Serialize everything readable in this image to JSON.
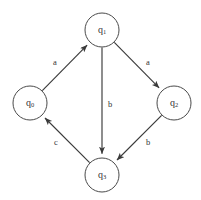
{
  "diagram": {
    "type": "state-transition-diagram",
    "title": "",
    "width": 201,
    "height": 200,
    "background_color": "#ffffff",
    "node_stroke_color": "#4a4a4a",
    "edge_color": "#3a3a3a",
    "text_color": "#333333",
    "nodes": [
      {
        "id": "q0",
        "base": "q",
        "sub": "0",
        "label": "q0",
        "cx": 30,
        "cy": 103,
        "r": 17
      },
      {
        "id": "q1",
        "base": "q",
        "sub": "1",
        "label": "q1",
        "cx": 102,
        "cy": 30,
        "r": 17
      },
      {
        "id": "q2",
        "base": "q",
        "sub": "2",
        "label": "q2",
        "cx": 174,
        "cy": 103,
        "r": 17
      },
      {
        "id": "q3",
        "base": "q",
        "sub": "3",
        "label": "q3",
        "cx": 102,
        "cy": 175,
        "r": 17
      }
    ],
    "edges": [
      {
        "id": "e0",
        "from": "q0",
        "to": "q1",
        "label": "a",
        "label_x": 55,
        "label_y": 63
      },
      {
        "id": "e1",
        "from": "q1",
        "to": "q2",
        "label": "a",
        "label_x": 148,
        "label_y": 63
      },
      {
        "id": "e2",
        "from": "q1",
        "to": "q3",
        "label": "b",
        "label_x": 110,
        "label_y": 105
      },
      {
        "id": "e3",
        "from": "q2",
        "to": "q3",
        "label": "b",
        "label_x": 148,
        "label_y": 143
      },
      {
        "id": "e4",
        "from": "q3",
        "to": "q0",
        "label": "c",
        "label_x": 56,
        "label_y": 143
      }
    ]
  }
}
